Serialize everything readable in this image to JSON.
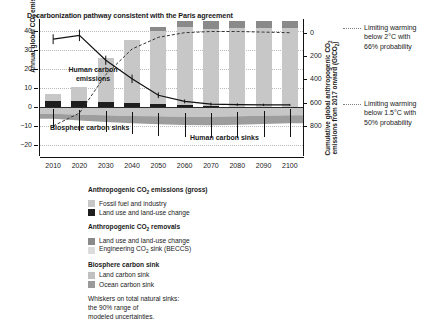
{
  "chart_data": {
    "type": "bar",
    "title": "Decarbonization pathway consistent with the Paris agreement",
    "ylabel_left": "Annual global CO2 emissions (GtCO2/yr)",
    "ylabel_right": "Cumulative global anthropogenic CO2 emissions from 2017 onward (GtCO2)",
    "xlabel": "",
    "categories": [
      "2010",
      "2020",
      "2030",
      "2040",
      "2050",
      "2060",
      "2070",
      "2080",
      "2090",
      "2100"
    ],
    "ylim_left": [
      -25,
      45
    ],
    "yticks_left": [
      -20,
      -10,
      0,
      10,
      20,
      30,
      40
    ],
    "ylim_right": [
      -250,
      900
    ],
    "yticks_right": [
      0,
      200,
      400,
      600,
      800
    ],
    "grid": "dotted horizontal at 10, 20, 30, 40 and -10, -20",
    "legend_position": "below-plot",
    "series": [
      {
        "name": "Fossil fuel and industry",
        "color": "#c7c7c7",
        "values": [
          3.5,
          7.6,
          23.2,
          33.3,
          38.4,
          41.0,
          40.5,
          41.2,
          41.4,
          41.5
        ]
      },
      {
        "name": "Land use and land-use change (gross emissions)",
        "color": "#1e1e1e",
        "values": [
          3.3,
          3.1,
          2.6,
          2.0,
          1.4,
          0.9,
          0.5,
          0.3,
          0.2,
          0.1
        ]
      },
      {
        "name": "Land use and land-use change (removals)",
        "color": "#8a8a8a",
        "values": [
          0,
          0,
          0,
          0,
          2.0,
          4.0,
          5.5,
          6.5,
          7.0,
          7.5
        ]
      },
      {
        "name": "Engineering CO2 sink (BECCS)",
        "color": "#dcdcdc",
        "values": [
          0,
          0,
          0,
          0,
          0,
          0,
          2.5,
          5.5,
          9.5,
          14.0
        ]
      },
      {
        "name": "Land carbon sink",
        "color": "#c0c0c0",
        "values": [
          -3.5,
          -4.0,
          -4.3,
          -4.6,
          -4.8,
          -5.0,
          -5.0,
          -4.8,
          -4.5,
          -4.2
        ]
      },
      {
        "name": "Ocean carbon sink",
        "color": "#9a9a9a",
        "values": [
          -2.6,
          -3.0,
          -3.4,
          -3.8,
          -4.1,
          -4.3,
          -4.4,
          -4.4,
          -4.3,
          -4.2
        ]
      }
    ],
    "net_emission_line": {
      "name": "Net anthropogenic CO2 emissions",
      "x": [
        "2010",
        "2020",
        "2030",
        "2040",
        "2050",
        "2060",
        "2070",
        "2080",
        "2090",
        "2100"
      ],
      "values": [
        35.5,
        37.5,
        24.5,
        14.8,
        6.2,
        3.0,
        1.6,
        1.3,
        1.2,
        1.2
      ]
    },
    "cumulative_dashed_line": {
      "name": "Cumulative anthropogenic CO2 emissions from 2017 onward",
      "right_axis_values": [
        0,
        110,
        440,
        660,
        760,
        800,
        810,
        810,
        805,
        800
      ]
    },
    "whisker_note": "Whiskers on total natural sinks: the 90% range of modeled uncertainties",
    "annotations": [
      {
        "text": "Human carbon emissions",
        "position": "upper-left-in-plot"
      },
      {
        "text": "Biosphere carbon sinks",
        "position": "lower-left-in-plot"
      },
      {
        "text": "Human carbon sinks",
        "position": "lower-right-in-plot"
      }
    ]
  },
  "chart": {
    "title": "Decarbonization pathway consistent with the Paris agreement",
    "y_left_title_parts": {
      "a": "Annual global CO",
      "b": "2",
      "c": " emissions (GtCO",
      "d": "2",
      "e": "/yr)"
    },
    "y_right_title_line1_a": "Cumulative global anthropogenic CO",
    "y_right_title_line1_b": "2",
    "y_right_title_line2_a": "emissions from 2017 onward (GtCO",
    "y_right_title_line2_b": "2",
    "y_right_title_line2_c": ")",
    "yticks_left": [
      "40",
      "30",
      "20",
      "10",
      "0",
      "−10",
      "−20"
    ],
    "yticks_right": [
      "800",
      "600",
      "400",
      "200",
      "0"
    ],
    "xticks": [
      "2010",
      "2020",
      "2030",
      "2040",
      "2050",
      "2060",
      "2070",
      "2080",
      "2090",
      "2100"
    ],
    "note_human_emissions_line1": "Human carbon",
    "note_human_emissions_line2": "emissions",
    "note_biosphere_sinks": "Biosphere carbon sinks",
    "note_human_sinks": "Human carbon sinks"
  },
  "right_annotations": [
    {
      "line1": "Limiting warming",
      "line2": "below 2°C with",
      "line3": "66% probability"
    },
    {
      "line1": "Limiting warming",
      "line2": "below 1.5°C with",
      "line3": "50% probability"
    }
  ],
  "legend": {
    "group1_title_a": "Anthropogenic CO",
    "group1_title_b": "2",
    "group1_title_c": " emissions (gross)",
    "group1_items": [
      {
        "label": "Fossil fuel and industry",
        "color": "#c7c7c7"
      },
      {
        "label": "Land use and land-use change",
        "color": "#1e1e1e"
      }
    ],
    "group2_title_a": "Anthropogenic CO",
    "group2_title_b": "2",
    "group2_title_c": " removals",
    "group2_items": [
      {
        "label": "Land use and land-use change",
        "color": "#8a8a8a"
      },
      {
        "label_a": "Engineering CO",
        "label_b": "2",
        "label_c": " sink (BECCS)",
        "color": "#dcdcdc"
      }
    ],
    "group3_title": "Biosphere carbon sink",
    "group3_items": [
      {
        "label": "Land carbon sink",
        "color": "#c0c0c0"
      },
      {
        "label": "Ocean carbon sink",
        "color": "#9a9a9a"
      }
    ],
    "footnote_line1": "Whiskers on total natural sinks:",
    "footnote_line2": "the 90% range of",
    "footnote_line3": "modeled uncertainties."
  }
}
